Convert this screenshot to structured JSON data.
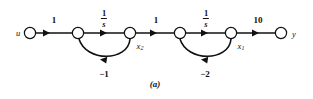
{
  "figure": {
    "caption": "(a)",
    "type": "signal-flow-graph",
    "background_color": "#ffffff",
    "ink_color": "#111111"
  },
  "io": {
    "input_label": "u",
    "output_label": "y"
  },
  "states": {
    "x2_label": "x",
    "x2_sub": "2",
    "x1_label": "x",
    "x1_sub": "1"
  },
  "edges": {
    "gain1": "1",
    "integrator1_num": "1",
    "integrator1_den": "s",
    "gain2": "1",
    "integrator2_num": "1",
    "integrator2_den": "s",
    "gain3": "10",
    "feedback1": "−1",
    "feedback2": "−2"
  },
  "nodes": [
    {
      "id": "n-u",
      "name": "input-node"
    },
    {
      "id": "n-2",
      "name": "summing-node-2"
    },
    {
      "id": "n-x2",
      "name": "state-node-x2"
    },
    {
      "id": "n-4",
      "name": "summing-node-1"
    },
    {
      "id": "n-x1",
      "name": "state-node-x1"
    },
    {
      "id": "n-y",
      "name": "output-node"
    }
  ]
}
